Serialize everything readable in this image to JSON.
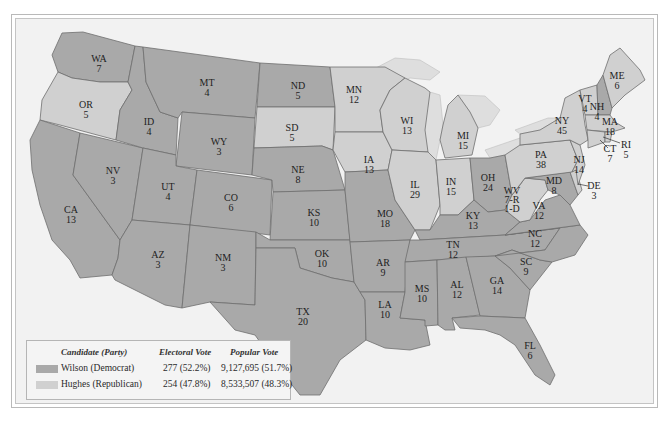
{
  "legend": {
    "headers": {
      "candidate": "Candidate (Party)",
      "electoral": "Electoral Vote",
      "popular": "Popular Vote"
    },
    "rows": [
      {
        "candidate": "Wilson (Democrat)",
        "electoral": "277 (52.2%)",
        "popular": "9,127,695 (51.7%)",
        "color": "#a9a9a9"
      },
      {
        "candidate": "Hughes (Republican)",
        "electoral": "254 (47.8%)",
        "popular": "8,533,507 (48.3%)",
        "color": "#d0d0d0"
      }
    ]
  },
  "colors": {
    "democrat": "#a9a9a9",
    "republican": "#d0d0d0",
    "background": "#f2f2f2"
  },
  "states": {
    "WA": {
      "abbr": "WA",
      "votes": "7",
      "party": "democrat"
    },
    "OR": {
      "abbr": "OR",
      "votes": "5",
      "party": "republican"
    },
    "CA": {
      "abbr": "CA",
      "votes": "13",
      "party": "democrat"
    },
    "NV": {
      "abbr": "NV",
      "votes": "3",
      "party": "democrat"
    },
    "ID": {
      "abbr": "ID",
      "votes": "4",
      "party": "democrat"
    },
    "MT": {
      "abbr": "MT",
      "votes": "4",
      "party": "democrat"
    },
    "WY": {
      "abbr": "WY",
      "votes": "3",
      "party": "democrat"
    },
    "UT": {
      "abbr": "UT",
      "votes": "4",
      "party": "democrat"
    },
    "AZ": {
      "abbr": "AZ",
      "votes": "3",
      "party": "democrat"
    },
    "CO": {
      "abbr": "CO",
      "votes": "6",
      "party": "democrat"
    },
    "NM": {
      "abbr": "NM",
      "votes": "3",
      "party": "democrat"
    },
    "ND": {
      "abbr": "ND",
      "votes": "5",
      "party": "democrat"
    },
    "SD": {
      "abbr": "SD",
      "votes": "5",
      "party": "republican"
    },
    "NE": {
      "abbr": "NE",
      "votes": "8",
      "party": "democrat"
    },
    "KS": {
      "abbr": "KS",
      "votes": "10",
      "party": "democrat"
    },
    "OK": {
      "abbr": "OK",
      "votes": "10",
      "party": "democrat"
    },
    "TX": {
      "abbr": "TX",
      "votes": "20",
      "party": "democrat"
    },
    "MN": {
      "abbr": "MN",
      "votes": "12",
      "party": "republican"
    },
    "IA": {
      "abbr": "IA",
      "votes": "13",
      "party": "republican"
    },
    "MO": {
      "abbr": "MO",
      "votes": "18",
      "party": "democrat"
    },
    "AR": {
      "abbr": "AR",
      "votes": "9",
      "party": "democrat"
    },
    "LA": {
      "abbr": "LA",
      "votes": "10",
      "party": "democrat"
    },
    "WI": {
      "abbr": "WI",
      "votes": "13",
      "party": "republican"
    },
    "IL": {
      "abbr": "IL",
      "votes": "29",
      "party": "republican"
    },
    "MI": {
      "abbr": "MI",
      "votes": "15",
      "party": "republican"
    },
    "IN": {
      "abbr": "IN",
      "votes": "15",
      "party": "republican"
    },
    "OH": {
      "abbr": "OH",
      "votes": "24",
      "party": "democrat"
    },
    "KY": {
      "abbr": "KY",
      "votes": "13",
      "party": "democrat"
    },
    "TN": {
      "abbr": "TN",
      "votes": "12",
      "party": "democrat"
    },
    "MS": {
      "abbr": "MS",
      "votes": "10",
      "party": "democrat"
    },
    "AL": {
      "abbr": "AL",
      "votes": "12",
      "party": "democrat"
    },
    "GA": {
      "abbr": "GA",
      "votes": "14",
      "party": "democrat"
    },
    "FL": {
      "abbr": "FL",
      "votes": "6",
      "party": "democrat"
    },
    "SC": {
      "abbr": "SC",
      "votes": "9",
      "party": "democrat"
    },
    "NC": {
      "abbr": "NC",
      "votes": "12",
      "party": "democrat"
    },
    "VA": {
      "abbr": "VA",
      "votes": "12",
      "party": "democrat"
    },
    "WV": {
      "abbr": "WV",
      "votes_line1": "7-R",
      "votes_line2": "1-D",
      "party": "republican"
    },
    "MD": {
      "abbr": "MD",
      "votes": "8",
      "party": "democrat"
    },
    "DE": {
      "abbr": "DE",
      "votes": "3",
      "party": "republican"
    },
    "PA": {
      "abbr": "PA",
      "votes": "38",
      "party": "republican"
    },
    "NJ": {
      "abbr": "NJ",
      "votes": "14",
      "party": "republican"
    },
    "NY": {
      "abbr": "NY",
      "votes": "45",
      "party": "republican"
    },
    "CT": {
      "abbr": "CT",
      "votes": "7",
      "party": "republican"
    },
    "RI": {
      "abbr": "RI",
      "votes": "5",
      "party": "republican"
    },
    "MA": {
      "abbr": "MA",
      "votes": "18",
      "party": "republican"
    },
    "VT": {
      "abbr": "VT",
      "votes": "4",
      "party": "republican"
    },
    "NH": {
      "abbr": "NH",
      "votes": "4",
      "party": "democrat"
    },
    "ME": {
      "abbr": "ME",
      "votes": "6",
      "party": "republican"
    }
  }
}
